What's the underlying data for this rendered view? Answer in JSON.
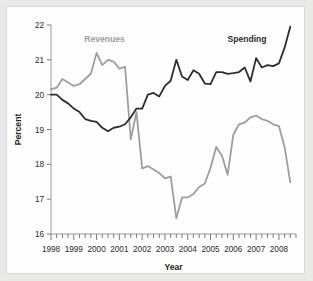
{
  "chart_data": {
    "type": "line",
    "title": "",
    "xlabel": "Year",
    "ylabel": "Percent",
    "xlim": [
      1998.0,
      2008.75
    ],
    "ylim": [
      16,
      22
    ],
    "yticks": [
      16,
      17,
      18,
      19,
      20,
      21,
      22
    ],
    "ytick_labels": [
      "16",
      "17",
      "18",
      "19",
      "20",
      "21",
      "22"
    ],
    "xticks": [
      1998,
      1999,
      2000,
      2001,
      2002,
      2003,
      2004,
      2005,
      2006,
      2007,
      2008
    ],
    "xtick_labels": [
      "1998",
      "1999",
      "2000",
      "2001",
      "2002",
      "2003",
      "2004",
      "2005",
      "2006",
      "2007",
      "2008"
    ],
    "minor_xtick_interval": 0.25,
    "grid": false,
    "legend_position": "inline-annotation",
    "x": [
      1998.0,
      1998.25,
      1998.5,
      1998.75,
      1999.0,
      1999.25,
      1999.5,
      1999.75,
      2000.0,
      2000.25,
      2000.5,
      2000.75,
      2001.0,
      2001.25,
      2001.5,
      2001.75,
      2002.0,
      2002.25,
      2002.5,
      2002.75,
      2003.0,
      2003.25,
      2003.5,
      2003.75,
      2004.0,
      2004.25,
      2004.5,
      2004.75,
      2005.0,
      2005.25,
      2005.5,
      2005.75,
      2006.0,
      2006.25,
      2006.5,
      2006.75,
      2007.0,
      2007.25,
      2007.5,
      2007.75,
      2008.0,
      2008.25,
      2008.5
    ],
    "series": [
      {
        "name": "Revenues",
        "color": "#9e9e9e",
        "label_x": 2000.35,
        "label_y": 21.52,
        "values": [
          20.15,
          20.2,
          20.45,
          20.35,
          20.25,
          20.3,
          20.45,
          20.6,
          21.2,
          20.85,
          21.0,
          20.95,
          20.75,
          20.8,
          18.72,
          19.5,
          17.88,
          17.95,
          17.85,
          17.75,
          17.6,
          17.65,
          16.45,
          17.05,
          17.05,
          17.15,
          17.35,
          17.45,
          17.9,
          18.5,
          18.25,
          17.7,
          18.85,
          19.15,
          19.2,
          19.35,
          19.4,
          19.3,
          19.25,
          19.15,
          19.1,
          18.5,
          17.48
        ]
      },
      {
        "name": "Spending",
        "color": "#2e2e2e",
        "label_x": 2006.6,
        "label_y": 21.52,
        "values": [
          20.0,
          20.0,
          19.85,
          19.75,
          19.6,
          19.5,
          19.3,
          19.25,
          19.22,
          19.05,
          18.95,
          19.05,
          19.08,
          19.15,
          19.35,
          19.6,
          19.6,
          20.0,
          20.05,
          19.95,
          20.25,
          20.4,
          21.0,
          20.52,
          20.42,
          20.7,
          20.6,
          20.32,
          20.3,
          20.65,
          20.65,
          20.6,
          20.62,
          20.65,
          20.78,
          20.38,
          21.05,
          20.78,
          20.85,
          20.82,
          20.9,
          21.35,
          21.95
        ]
      }
    ]
  }
}
